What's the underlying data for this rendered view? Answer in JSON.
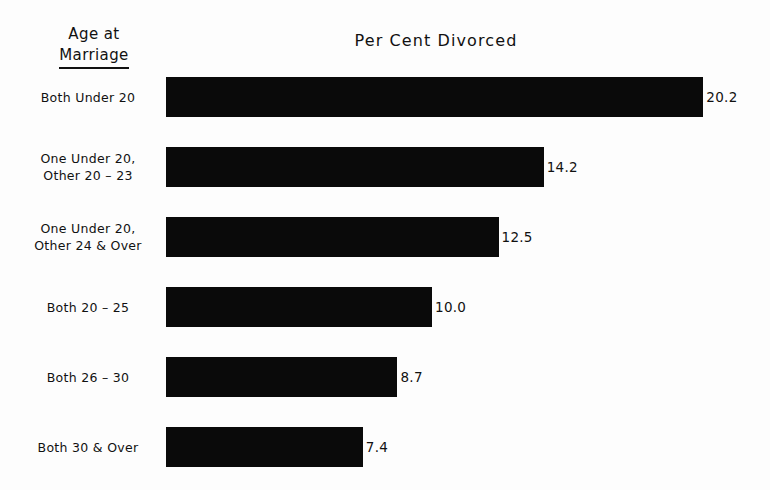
{
  "chart_data": {
    "type": "bar",
    "orientation": "horizontal",
    "title": "Per Cent Divorced",
    "xlabel": "",
    "ylabel": "Age at Marriage",
    "category_header_line1": "Age at",
    "category_header_line2": "Marriage",
    "categories": [
      "Both Under 20",
      "One Under 20,\nOther 20 – 23",
      "One Under 20,\nOther 24 & Over",
      "Both 20 – 25",
      "Both 26 – 30",
      "Both 30 & Over"
    ],
    "values": [
      20.2,
      14.2,
      12.5,
      10.0,
      8.7,
      7.4
    ],
    "value_labels": [
      "20.2",
      "14.2",
      "12.5",
      "10.0",
      "8.7",
      "7.4"
    ],
    "xlim": [
      0,
      21
    ],
    "grid": false,
    "legend": null,
    "bar_color": "#0a0a0a",
    "background_color": "#fdfdfd"
  },
  "layout": {
    "plot_left_px": 166,
    "px_per_unit": 26.6,
    "bar_height_px": 40,
    "row_tops_px": [
      77,
      147,
      217,
      287,
      357,
      427
    ]
  }
}
